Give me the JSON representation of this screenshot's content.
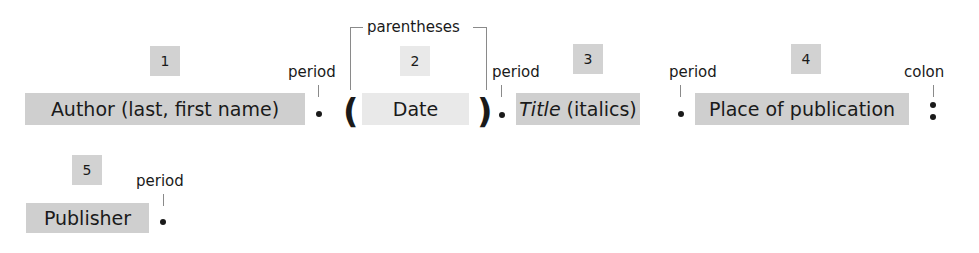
{
  "diagram": {
    "components": [
      {
        "number": "1",
        "label": "Author (last, first name)",
        "shade": "#cfcfcf"
      },
      {
        "number": "2",
        "label": "Date",
        "shade": "#e9e9e9"
      },
      {
        "number": "3",
        "label_italic": "Title",
        "label_rest": " (italics)",
        "shade": "#cfcfcf"
      },
      {
        "number": "4",
        "label": "Place of publication",
        "shade": "#cfcfcf"
      },
      {
        "number": "5",
        "label": "Publisher",
        "shade": "#cfcfcf"
      }
    ],
    "punctuation": {
      "period": "period",
      "parentheses": "parentheses",
      "colon": "colon",
      "open_paren": "(",
      "close_paren": ")"
    }
  }
}
